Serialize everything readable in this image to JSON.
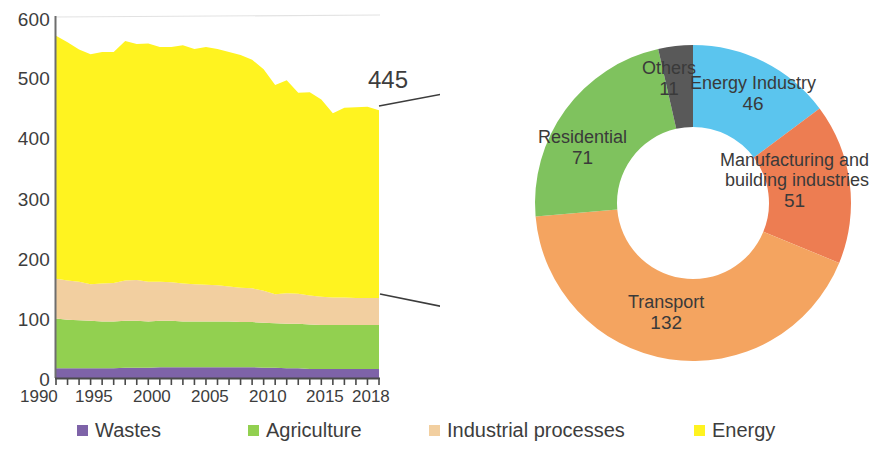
{
  "chart_data": [
    {
      "type": "area",
      "title": "",
      "xlabel": "",
      "ylabel": "",
      "stacked": true,
      "grid": false,
      "legend_position": "bottom",
      "xlim": [
        1990,
        2018
      ],
      "ylim": [
        0,
        600
      ],
      "ytick_labels": [
        "0",
        "100",
        "200",
        "300",
        "400",
        "500",
        "600"
      ],
      "yticks": [
        0,
        100,
        200,
        300,
        400,
        500,
        600
      ],
      "xtick_labels": [
        "1990",
        "1995",
        "2000",
        "2005",
        "2010",
        "2015",
        "2018"
      ],
      "xticks": [
        1990,
        1995,
        2000,
        2005,
        2010,
        2015,
        2018
      ],
      "x": [
        1990,
        1991,
        1992,
        1993,
        1994,
        1995,
        1996,
        1997,
        1998,
        1999,
        2000,
        2001,
        2002,
        2003,
        2004,
        2005,
        2006,
        2007,
        2008,
        2009,
        2010,
        2011,
        2012,
        2013,
        2014,
        2015,
        2016,
        2017,
        2018
      ],
      "series": [
        {
          "name": "Wastes",
          "color": "#7E63A8",
          "values": [
            16,
            16,
            16,
            16,
            16,
            16,
            17,
            17,
            17,
            18,
            18,
            18,
            18,
            18,
            18,
            18,
            18,
            18,
            17,
            17,
            16,
            16,
            15,
            15,
            15,
            15,
            15,
            15,
            15
          ]
        },
        {
          "name": "Agriculture",
          "color": "#92D050",
          "values": [
            83,
            81,
            80,
            79,
            78,
            78,
            78,
            78,
            77,
            77,
            77,
            76,
            76,
            76,
            76,
            76,
            75,
            75,
            75,
            74,
            74,
            74,
            74,
            73,
            73,
            73,
            73,
            73,
            73
          ]
        },
        {
          "name": "Industrial processes",
          "color": "#F2CFA0",
          "values": [
            66,
            65,
            64,
            61,
            63,
            64,
            67,
            68,
            66,
            65,
            64,
            63,
            62,
            61,
            60,
            58,
            57,
            56,
            53,
            48,
            51,
            50,
            48,
            47,
            46,
            46,
            45,
            45,
            45
          ]
        },
        {
          "name": "Energy",
          "color": "#FFF320",
          "values": [
            404,
            396,
            386,
            382,
            385,
            384,
            398,
            392,
            396,
            390,
            391,
            396,
            391,
            395,
            393,
            390,
            387,
            380,
            368,
            348,
            354,
            334,
            338,
            328,
            306,
            315,
            317,
            318,
            312
          ]
        }
      ],
      "callout": {
        "label": "445",
        "value": 445,
        "year": 2018
      }
    },
    {
      "type": "pie",
      "donut": true,
      "title": "",
      "grid": false,
      "legend_position": "none",
      "total": 311,
      "start_angle_deg": 0,
      "direction": "clockwise",
      "labels": [
        "Energy Industry",
        "Manufacturing and building industries",
        "Transport",
        "Residential",
        "Others"
      ],
      "values": [
        46,
        51,
        132,
        71,
        11
      ],
      "colors": [
        "#5BC5EE",
        "#ED7D52",
        "#F4A460",
        "#7FC25E",
        "#595959"
      ],
      "slices": [
        {
          "name": "Energy Industry",
          "line1": "Energy Industry",
          "value": "46",
          "color": "#5BC5EE"
        },
        {
          "name": "Manufacturing and building industries",
          "line1": "Manufacturing and",
          "line2": "building industries",
          "value": "51",
          "color": "#ED7D52"
        },
        {
          "name": "Transport",
          "line1": "Transport",
          "value": "132",
          "color": "#F4A460"
        },
        {
          "name": "Residential",
          "line1": "Residential",
          "value": "71",
          "color": "#7FC25E"
        },
        {
          "name": "Others",
          "line1": "Others",
          "value": "11",
          "color": "#595959"
        }
      ]
    }
  ],
  "area_chart": {
    "ytick_labels": [
      "600",
      "500",
      "400",
      "300",
      "200",
      "100",
      "0"
    ],
    "xtick_labels": [
      "1990",
      "1995",
      "2000",
      "2005",
      "2010",
      "2015",
      "2018"
    ],
    "callout_label": "445"
  },
  "donut": {
    "others_label": "Others",
    "others_value": "11",
    "energy_industry_label": "Energy Industry",
    "energy_industry_value": "46",
    "manufacturing_line1": "Manufacturing and",
    "manufacturing_line2": "building industries",
    "manufacturing_value": "51",
    "residential_label": "Residential",
    "residential_value": "71",
    "transport_label": "Transport",
    "transport_value": "132"
  },
  "legend": {
    "items": [
      {
        "label": "Wastes",
        "color": "#7E63A8"
      },
      {
        "label": "Agriculture",
        "color": "#92D050"
      },
      {
        "label": "Industrial processes",
        "color": "#F2CFA0"
      },
      {
        "label": "Energy",
        "color": "#FFF320"
      }
    ]
  }
}
